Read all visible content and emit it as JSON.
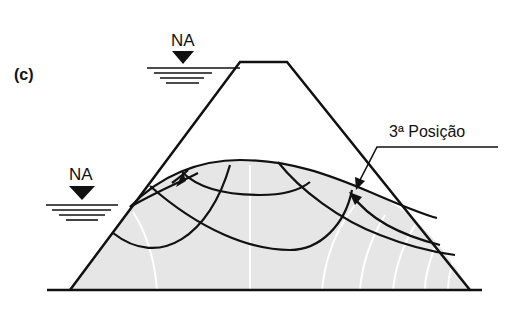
{
  "figure": {
    "panel_label": "(c)",
    "water_level_upstream_top": "NA",
    "water_level_upstream_bottom": "NA",
    "annotation": "3ª Posição"
  },
  "colors": {
    "line": "#111111",
    "fill": "#e6e6e6",
    "flowline": "#ffffff",
    "background": "#ffffff"
  }
}
